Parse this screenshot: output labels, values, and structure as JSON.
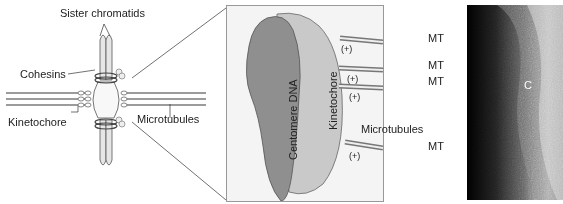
{
  "left_panel": {
    "labels": {
      "sister_chromatids": "Sister chromatids",
      "cohesins": "Cohesins",
      "kinetochore": "Kinetochore",
      "microtubules": "Microtubules"
    }
  },
  "center_panel": {
    "labels": {
      "centromere_dna": "Centomere DNA",
      "kinetochore": "Kinetochore",
      "microtubules": "Microtubules",
      "plus_ends": [
        "(+)",
        "(+)",
        "(+)",
        "(+)"
      ],
      "mt_labels": [
        "MT",
        "MT",
        "MT",
        "MT"
      ]
    }
  },
  "right_panel": {
    "type": "micrograph",
    "labels": {
      "c": "C"
    }
  },
  "colors": {
    "chromatid_fill": "#e6e6e6",
    "centromere_fill": "#8f8f8f",
    "kinetochore_fill": "#c9c9c9",
    "outline": "#555555"
  }
}
